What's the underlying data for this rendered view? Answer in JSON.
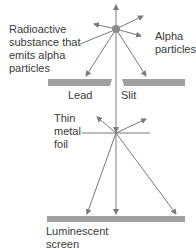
{
  "diagram": {
    "labels": {
      "source": "Radioactive\nsubstance that\nemits alpha\nparticles",
      "alpha": "Alpha\nparticles",
      "lead": "Lead",
      "slit": "Slit",
      "foil": "Thin\nmetal\nfoil",
      "screen": "Luminescent\nscreen"
    },
    "colors": {
      "line": "#7a7a7a",
      "plate": "#a0a0a0",
      "source": "#8a8a8a",
      "text": "#3a3a3a"
    }
  }
}
